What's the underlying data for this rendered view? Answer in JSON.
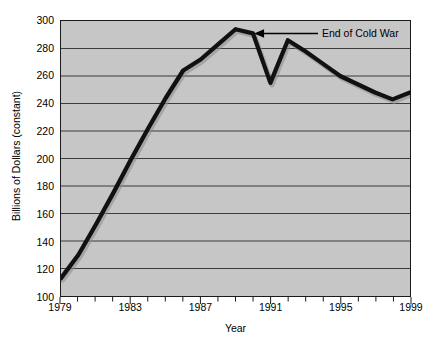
{
  "chart_data": {
    "type": "line",
    "title": "",
    "xlabel": "Year",
    "ylabel": "Billions of Dollars (constant)",
    "xlim": [
      1979,
      1999
    ],
    "ylim": [
      100,
      300
    ],
    "yticks": [
      100,
      120,
      140,
      160,
      180,
      200,
      220,
      240,
      260,
      280,
      300
    ],
    "ytick_labels": [
      "100",
      "120",
      "140",
      "160",
      "180",
      "200",
      "220",
      "240",
      "260",
      "280",
      "300"
    ],
    "xticks": [
      1979,
      1983,
      1987,
      1991,
      1995,
      1999
    ],
    "xtick_labels": [
      "1979",
      "1983",
      "1987",
      "1991",
      "1995",
      "1999"
    ],
    "xtick_minor_step": 1,
    "grid": "horizontal",
    "legend": "none",
    "line_color": "#111111",
    "plot_background": "#c6c6c6",
    "page_background": "#ffffff",
    "x": [
      1979,
      1980,
      1981,
      1982,
      1983,
      1984,
      1985,
      1986,
      1987,
      1988,
      1989,
      1990,
      1991,
      1992,
      1993,
      1994,
      1995,
      1996,
      1997,
      1998,
      1999
    ],
    "values": [
      113,
      130,
      152,
      175,
      199,
      222,
      244,
      264,
      272,
      283,
      294,
      291,
      255,
      286,
      278,
      269,
      260,
      254,
      248,
      243,
      248
    ],
    "series": [
      {
        "name": "Defense spending",
        "values": [
          113,
          130,
          152,
          175,
          199,
          222,
          244,
          264,
          272,
          283,
          294,
          291,
          255,
          286,
          278,
          269,
          260,
          254,
          248,
          243,
          248
        ]
      }
    ],
    "annotations": [
      {
        "text": "End of Cold War",
        "arrow": "left",
        "points_to_year": 1990,
        "points_to_value": 291
      }
    ]
  }
}
